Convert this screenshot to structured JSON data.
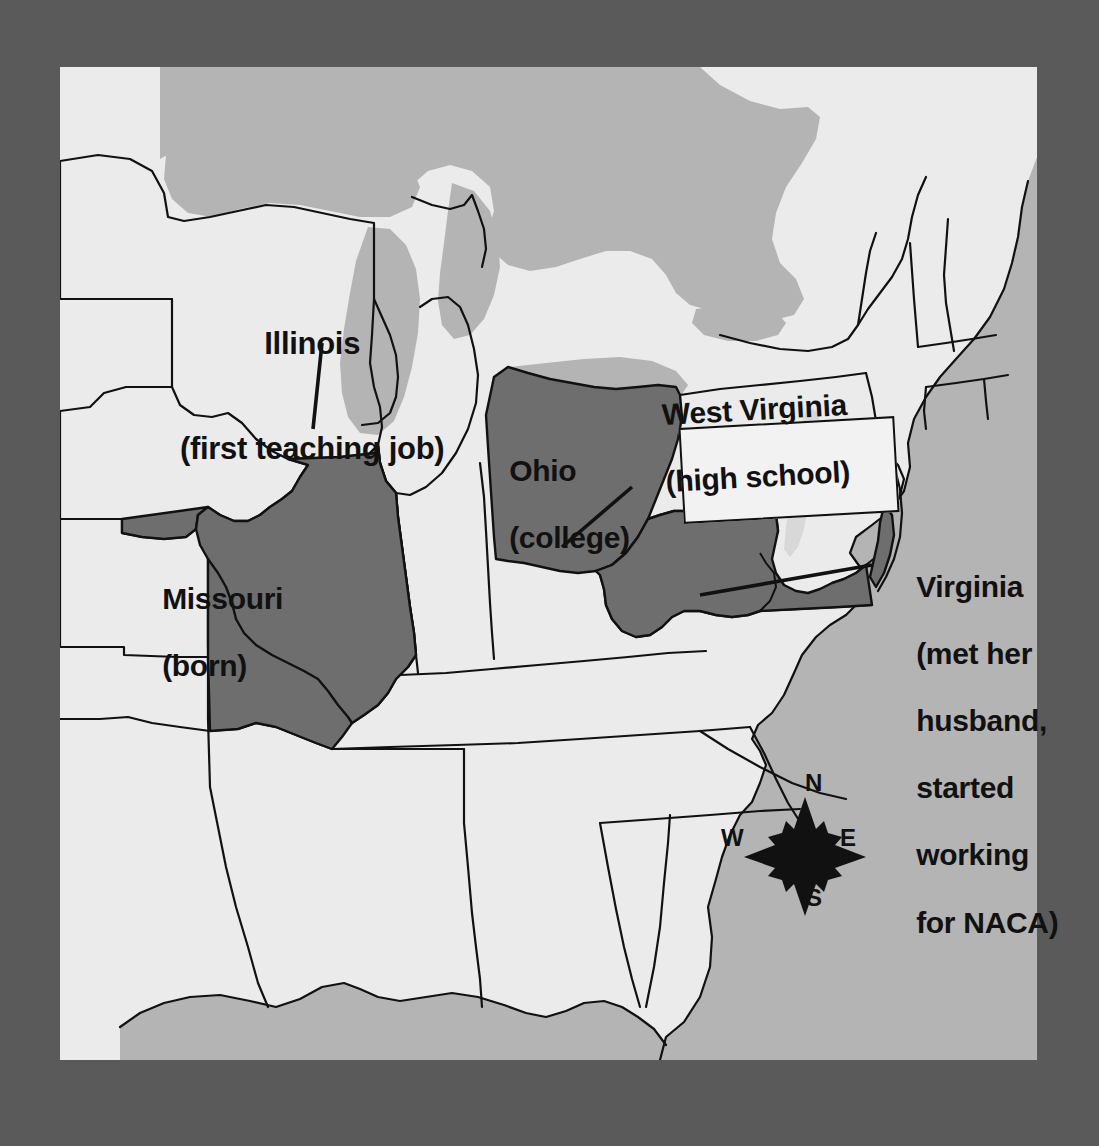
{
  "map": {
    "title": "Katherine Johnson life map of eastern United States",
    "colors": {
      "page_background": "#5a5a5a",
      "land": "#ebebeb",
      "water": "#b4b4b4",
      "highlight_state": "#6e6e6e",
      "border": "#111111",
      "text": "#111111",
      "callout_fill": "#f2f2f2"
    },
    "labels": [
      {
        "id": "illinois",
        "state": "Illinois",
        "note": "(first teaching job)",
        "lines": [
          "Illinois",
          "(first teaching job)"
        ],
        "has_leader_line": true,
        "has_callout_box": false
      },
      {
        "id": "missouri",
        "state": "Missouri",
        "note": "(born)",
        "lines": [
          "Missouri",
          "(born)"
        ],
        "has_leader_line": false,
        "has_callout_box": false
      },
      {
        "id": "ohio",
        "state": "Ohio",
        "note": "(college)",
        "lines": [
          "Ohio",
          "(college)"
        ],
        "has_leader_line": false,
        "has_callout_box": false
      },
      {
        "id": "west-virginia",
        "state": "West Virginia",
        "note": "(high school)",
        "lines": [
          "West Virginia",
          "(high school)"
        ],
        "has_leader_line": true,
        "has_callout_box": true
      },
      {
        "id": "virginia",
        "state": "Virginia",
        "note": "(met her husband, started working for NACA)",
        "lines": [
          "Virginia",
          "(met her",
          "husband,",
          "started",
          "working",
          "for NACA)"
        ],
        "has_leader_line": true,
        "has_callout_box": false
      }
    ],
    "highlighted_states": [
      "Missouri",
      "Illinois",
      "Ohio",
      "West Virginia",
      "Virginia"
    ],
    "compass": {
      "north": "N",
      "south": "S",
      "east": "E",
      "west": "W"
    }
  }
}
